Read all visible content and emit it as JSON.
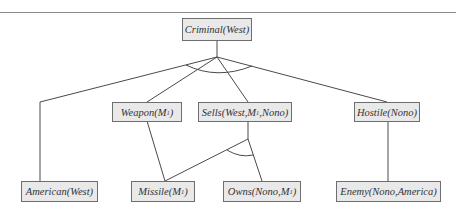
{
  "diagram": {
    "type": "and-or proof tree",
    "root": {
      "id": "criminal",
      "label_pre": "Criminal(West)",
      "label_sub": "",
      "label_post": ""
    },
    "nodes": [
      {
        "id": "criminal",
        "label_pre": "Criminal(West)",
        "label_sub": "",
        "label_post": ""
      },
      {
        "id": "weapon",
        "label_pre": "Weapon(M",
        "label_sub": "1",
        "label_post": ")"
      },
      {
        "id": "sells",
        "label_pre": "Sells(West,M",
        "label_sub": "1",
        "label_post": ",Nono)"
      },
      {
        "id": "hostile",
        "label_pre": "Hostile(Nono)",
        "label_sub": "",
        "label_post": ""
      },
      {
        "id": "american",
        "label_pre": "American(West)",
        "label_sub": "",
        "label_post": ""
      },
      {
        "id": "missile",
        "label_pre": "Missile(M",
        "label_sub": "1",
        "label_post": ")"
      },
      {
        "id": "owns",
        "label_pre": "Owns(Nono,M",
        "label_sub": "1",
        "label_post": ")"
      },
      {
        "id": "enemy",
        "label_pre": "Enemy(Nono,America)",
        "label_sub": "",
        "label_post": ""
      }
    ],
    "edges": [
      {
        "from": "criminal",
        "to": "american"
      },
      {
        "from": "criminal",
        "to": "weapon"
      },
      {
        "from": "criminal",
        "to": "sells"
      },
      {
        "from": "criminal",
        "to": "hostile"
      },
      {
        "from": "weapon",
        "to": "missile"
      },
      {
        "from": "sells",
        "to": "missile"
      },
      {
        "from": "sells",
        "to": "owns"
      },
      {
        "from": "hostile",
        "to": "enemy"
      }
    ],
    "and_arcs": [
      {
        "at": "criminal",
        "spans": [
          "american",
          "weapon",
          "sells",
          "hostile"
        ]
      },
      {
        "at": "sells",
        "spans": [
          "missile",
          "owns"
        ]
      }
    ],
    "colors": {
      "node_fill": "#e9e9e9",
      "node_border": "#6e6e6e",
      "edge": "#4a4a4a",
      "text": "#333333",
      "rule": "#8a8a8a"
    }
  }
}
